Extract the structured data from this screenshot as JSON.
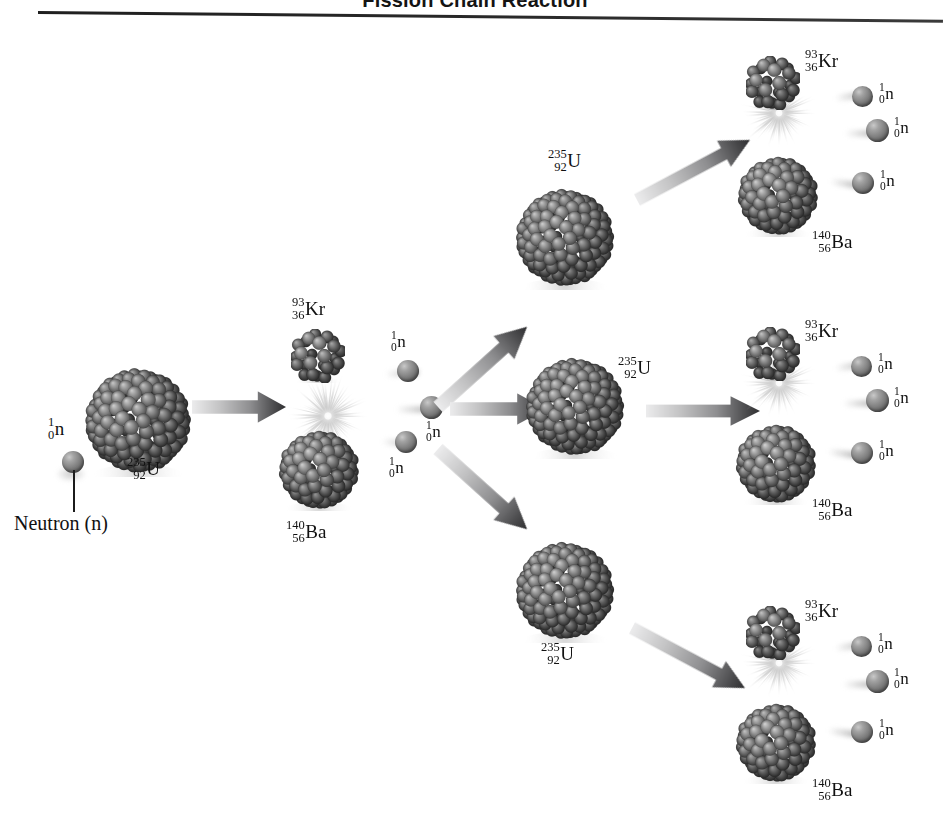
{
  "title": "Fission Chain Reaction",
  "figure": {
    "type": "diagram",
    "generations": 3,
    "neutrons_per_fission": 3
  },
  "callout": {
    "neutron_label": "Neutron (n)"
  },
  "isotopes": {
    "uranium": {
      "mass": "235",
      "atomic": "92",
      "symbol": "U"
    },
    "krypton": {
      "mass": "93",
      "atomic": "36",
      "symbol": "Kr"
    },
    "barium": {
      "mass": "140",
      "atomic": "56",
      "symbol": "Ba"
    },
    "neutron": {
      "mass": "1",
      "atomic": "0",
      "symbol": "n"
    }
  },
  "colors": {
    "background": "#ffffff",
    "nucleon_dark": "#5f5f5f",
    "nucleon_mid": "#7a7a7a",
    "nucleon_light": "#b4b4b4",
    "arrow_dark": "#333333",
    "arrow_light": "#d8d8d8",
    "text": "#111111",
    "rule": "#222222"
  },
  "stage1": {
    "incoming_neutron_label": {
      "mass": "1",
      "atomic": "0",
      "symbol": "n"
    },
    "target_label": {
      "mass": "235",
      "atomic": "92",
      "symbol": "U"
    },
    "products": {
      "krypton": {
        "mass": "93",
        "atomic": "36",
        "symbol": "Kr"
      },
      "barium": {
        "mass": "140",
        "atomic": "56",
        "symbol": "Ba"
      }
    },
    "emitted_neutrons": [
      {
        "mass": "1",
        "atomic": "0",
        "symbol": "n"
      },
      {
        "mass": "1",
        "atomic": "0",
        "symbol": "n"
      },
      {
        "mass": "1",
        "atomic": "0",
        "symbol": "n"
      }
    ]
  },
  "stage2": {
    "branches": [
      {
        "branch": "top",
        "target_label": {
          "mass": "235",
          "atomic": "92",
          "symbol": "U"
        }
      },
      {
        "branch": "middle",
        "target_label": {
          "mass": "235",
          "atomic": "92",
          "symbol": "U"
        }
      },
      {
        "branch": "bottom",
        "target_label": {
          "mass": "235",
          "atomic": "92",
          "symbol": "U"
        }
      }
    ]
  },
  "stage3": {
    "groups": [
      {
        "branch": "top",
        "krypton": {
          "mass": "93",
          "atomic": "36",
          "symbol": "Kr"
        },
        "barium": {
          "mass": "140",
          "atomic": "56",
          "symbol": "Ba"
        },
        "neutrons": [
          {
            "mass": "1",
            "atomic": "0",
            "symbol": "n"
          },
          {
            "mass": "1",
            "atomic": "0",
            "symbol": "n"
          },
          {
            "mass": "1",
            "atomic": "0",
            "symbol": "n"
          }
        ]
      },
      {
        "branch": "middle",
        "krypton": {
          "mass": "93",
          "atomic": "36",
          "symbol": "Kr"
        },
        "barium": {
          "mass": "140",
          "atomic": "56",
          "symbol": "Ba"
        },
        "neutrons": [
          {
            "mass": "1",
            "atomic": "0",
            "symbol": "n"
          },
          {
            "mass": "1",
            "atomic": "0",
            "symbol": "n"
          },
          {
            "mass": "1",
            "atomic": "0",
            "symbol": "n"
          }
        ]
      },
      {
        "branch": "bottom",
        "krypton": {
          "mass": "93",
          "atomic": "36",
          "symbol": "Kr"
        },
        "barium": {
          "mass": "140",
          "atomic": "56",
          "symbol": "Ba"
        },
        "neutrons": [
          {
            "mass": "1",
            "atomic": "0",
            "symbol": "n"
          },
          {
            "mass": "1",
            "atomic": "0",
            "symbol": "n"
          },
          {
            "mass": "1",
            "atomic": "0",
            "symbol": "n"
          }
        ]
      }
    ]
  }
}
